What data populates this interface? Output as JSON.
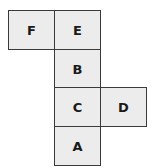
{
  "diagram": {
    "type": "cube-net",
    "faces": [
      {
        "label": "F",
        "row": 0,
        "col": 0
      },
      {
        "label": "E",
        "row": 0,
        "col": 1
      },
      {
        "label": "B",
        "row": 1,
        "col": 1
      },
      {
        "label": "C",
        "row": 2,
        "col": 1
      },
      {
        "label": "D",
        "row": 2,
        "col": 2
      },
      {
        "label": "A",
        "row": 3,
        "col": 1
      }
    ]
  }
}
